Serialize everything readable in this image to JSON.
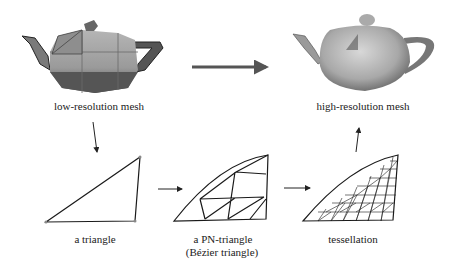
{
  "labels": {
    "low_res": "low-resolution mesh",
    "high_res": "high-resolution mesh",
    "triangle": "a triangle",
    "pn_line1": "a PN-triangle",
    "pn_line2": "(Bézier triangle)",
    "tessellation": "tessellation"
  },
  "colors": {
    "line": "#1a1a1a",
    "arrow": "#555555",
    "vertex": "#888888"
  }
}
